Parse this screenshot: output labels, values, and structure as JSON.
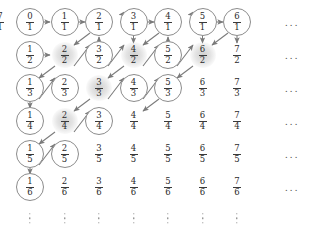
{
  "figure": {
    "type": "diagram",
    "grid": {
      "rows": 6,
      "cols": 7,
      "col_x": [
        30,
        64.5,
        99,
        133.5,
        168,
        202.5,
        237
      ],
      "row_y": [
        22,
        55,
        88,
        121,
        154,
        187
      ],
      "ellipsis_col_x": 292,
      "ellipsis_row_y": 218
    },
    "style": {
      "circle_stroke": "#8c8c8c",
      "shade_fill": "#afafaf",
      "arrow_color": "#7a7a7a",
      "text_color": "#2b2b2b",
      "background": "#ffffff"
    },
    "nodes": [
      [
        {
          "num": "0",
          "den": "1",
          "mark": "circled"
        },
        {
          "num": "1",
          "den": "1",
          "mark": "circled"
        },
        {
          "num": "2",
          "den": "1",
          "mark": "circled"
        },
        {
          "num": "3",
          "den": "1",
          "mark": "circled"
        },
        {
          "num": "4",
          "den": "1",
          "mark": "circled"
        },
        {
          "num": "5",
          "den": "1",
          "mark": "circled"
        },
        {
          "num": "6",
          "den": "1",
          "mark": "circled"
        },
        {
          "num": "7",
          "den": "1",
          "mark": "plain"
        }
      ],
      [
        {
          "num": "1",
          "den": "2",
          "mark": "circled"
        },
        {
          "num": "2",
          "den": "2",
          "mark": "shaded"
        },
        {
          "num": "3",
          "den": "2",
          "mark": "circled"
        },
        {
          "num": "4",
          "den": "2",
          "mark": "shaded"
        },
        {
          "num": "5",
          "den": "2",
          "mark": "circled"
        },
        {
          "num": "6",
          "den": "2",
          "mark": "shaded"
        },
        {
          "num": "7",
          "den": "2",
          "mark": "plain"
        }
      ],
      [
        {
          "num": "1",
          "den": "3",
          "mark": "circled"
        },
        {
          "num": "2",
          "den": "3",
          "mark": "circled"
        },
        {
          "num": "3",
          "den": "3",
          "mark": "shaded"
        },
        {
          "num": "4",
          "den": "3",
          "mark": "circled"
        },
        {
          "num": "5",
          "den": "3",
          "mark": "circled"
        },
        {
          "num": "6",
          "den": "3",
          "mark": "plain"
        },
        {
          "num": "7",
          "den": "3",
          "mark": "plain"
        }
      ],
      [
        {
          "num": "1",
          "den": "4",
          "mark": "circled"
        },
        {
          "num": "2",
          "den": "4",
          "mark": "shaded"
        },
        {
          "num": "3",
          "den": "4",
          "mark": "circled"
        },
        {
          "num": "4",
          "den": "4",
          "mark": "plain"
        },
        {
          "num": "5",
          "den": "4",
          "mark": "plain"
        },
        {
          "num": "6",
          "den": "4",
          "mark": "plain"
        },
        {
          "num": "7",
          "den": "4",
          "mark": "plain"
        }
      ],
      [
        {
          "num": "1",
          "den": "5",
          "mark": "circled"
        },
        {
          "num": "2",
          "den": "5",
          "mark": "circled"
        },
        {
          "num": "3",
          "den": "5",
          "mark": "plain"
        },
        {
          "num": "4",
          "den": "5",
          "mark": "plain"
        },
        {
          "num": "5",
          "den": "5",
          "mark": "plain"
        },
        {
          "num": "6",
          "den": "5",
          "mark": "plain"
        },
        {
          "num": "7",
          "den": "5",
          "mark": "plain"
        }
      ],
      [
        {
          "num": "1",
          "den": "6",
          "mark": "circled"
        },
        {
          "num": "2",
          "den": "6",
          "mark": "plain"
        },
        {
          "num": "3",
          "den": "6",
          "mark": "plain"
        },
        {
          "num": "4",
          "den": "6",
          "mark": "plain"
        },
        {
          "num": "5",
          "den": "6",
          "mark": "plain"
        },
        {
          "num": "6",
          "den": "6",
          "mark": "plain"
        },
        {
          "num": "7",
          "den": "6",
          "mark": "plain"
        }
      ]
    ],
    "row_ellipses": [
      "...",
      "...",
      "...",
      "...",
      "...",
      "..."
    ],
    "column_ellipsis_symbol": "vertical-dots",
    "path_edges": [
      {
        "from": [
          0,
          0
        ],
        "to": [
          0,
          1
        ],
        "kind": "right"
      },
      {
        "from": [
          0,
          1
        ],
        "to": [
          0,
          2
        ],
        "kind": "right"
      },
      {
        "from": [
          0,
          2
        ],
        "to": [
          1,
          1
        ],
        "kind": "down-left"
      },
      {
        "from": [
          1,
          1
        ],
        "to": [
          2,
          0
        ],
        "kind": "down-left"
      },
      {
        "from": [
          2,
          0
        ],
        "to": [
          3,
          0
        ],
        "kind": "down"
      },
      {
        "from": [
          3,
          0
        ],
        "to": [
          2,
          1
        ],
        "kind": "up-right"
      },
      {
        "from": [
          2,
          1
        ],
        "to": [
          1,
          2
        ],
        "kind": "up-right"
      },
      {
        "from": [
          1,
          2
        ],
        "to": [
          0,
          3
        ],
        "kind": "up-right"
      },
      {
        "from": [
          0,
          3
        ],
        "to": [
          0,
          4
        ],
        "kind": "right"
      },
      {
        "from": [
          0,
          4
        ],
        "to": [
          1,
          3
        ],
        "kind": "down-left"
      },
      {
        "from": [
          1,
          3
        ],
        "to": [
          2,
          2
        ],
        "kind": "down-left"
      },
      {
        "from": [
          2,
          2
        ],
        "to": [
          3,
          1
        ],
        "kind": "down-left"
      },
      {
        "from": [
          3,
          1
        ],
        "to": [
          4,
          0
        ],
        "kind": "down-left"
      },
      {
        "from": [
          4,
          0
        ],
        "to": [
          5,
          0
        ],
        "kind": "down"
      },
      {
        "from": [
          5,
          0
        ],
        "to": [
          4,
          1
        ],
        "kind": "up-right"
      },
      {
        "from": [
          4,
          1
        ],
        "to": [
          3,
          2
        ],
        "kind": "up-right"
      },
      {
        "from": [
          3,
          2
        ],
        "to": [
          2,
          3
        ],
        "kind": "up-right"
      },
      {
        "from": [
          2,
          3
        ],
        "to": [
          1,
          4
        ],
        "kind": "up-right"
      },
      {
        "from": [
          1,
          4
        ],
        "to": [
          0,
          5
        ],
        "kind": "up-right"
      },
      {
        "from": [
          0,
          5
        ],
        "to": [
          0,
          6
        ],
        "kind": "right"
      },
      {
        "from": [
          0,
          6
        ],
        "to": [
          1,
          5
        ],
        "kind": "down-left"
      },
      {
        "from": [
          1,
          5
        ],
        "to": [
          2,
          4
        ],
        "kind": "down-left"
      },
      {
        "from": [
          2,
          4
        ],
        "to": [
          3,
          3
        ],
        "kind": "down-left"
      },
      {
        "from": [
          1,
          0
        ],
        "to": [
          1,
          1
        ],
        "kind": "right"
      },
      {
        "from": [
          0,
          2
        ],
        "to": [
          1,
          1
        ],
        "kind": "down-left-extra"
      }
    ]
  }
}
